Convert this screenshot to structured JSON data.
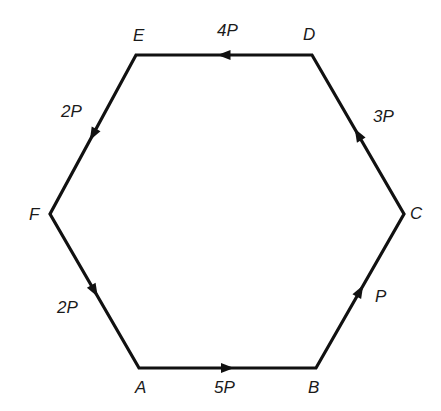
{
  "diagram": {
    "type": "hexagon-force-diagram",
    "vertices": {
      "A": {
        "label": "A",
        "x": 139,
        "y": 368,
        "lx": 135,
        "ly": 393
      },
      "B": {
        "label": "B",
        "x": 316,
        "y": 368,
        "lx": 308,
        "ly": 393
      },
      "C": {
        "label": "C",
        "x": 404,
        "y": 214,
        "lx": 410,
        "ly": 219
      },
      "D": {
        "label": "D",
        "x": 312,
        "y": 55,
        "lx": 303,
        "ly": 40
      },
      "E": {
        "label": "E",
        "x": 136,
        "y": 55,
        "lx": 133,
        "ly": 41
      },
      "F": {
        "label": "F",
        "x": 50,
        "y": 214,
        "lx": 29,
        "ly": 220
      }
    },
    "forces": [
      {
        "from": "A",
        "to": "B",
        "label": "5P",
        "lx": 214,
        "ly": 393
      },
      {
        "from": "B",
        "to": "C",
        "label": "P",
        "lx": 375,
        "ly": 302
      },
      {
        "from": "C",
        "to": "D",
        "label": "3P",
        "lx": 373,
        "ly": 122
      },
      {
        "from": "D",
        "to": "E",
        "label": "4P",
        "lx": 217,
        "ly": 36
      },
      {
        "from": "E",
        "to": "F",
        "label": "2P",
        "lx": 61,
        "ly": 117
      },
      {
        "from": "F",
        "to": "A",
        "label": "2P",
        "lx": 57,
        "ly": 313
      }
    ],
    "colors": {
      "line": "#111111",
      "background": "#ffffff"
    }
  }
}
